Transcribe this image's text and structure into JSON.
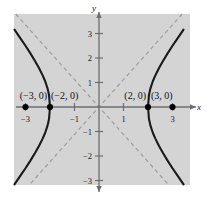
{
  "figure": {
    "title": "",
    "background_color": "#ffffff",
    "plot_background_color": "#d4d4d4",
    "axis_color": "#6e6e6e",
    "curve_color": "#1a1a1a",
    "asymptote_color": "#9a9a9a",
    "point_color": "#000000"
  },
  "axes": {
    "x_label": "x",
    "y_label": "y",
    "x_ticks": [
      {
        "value": -3,
        "label": "−3"
      },
      {
        "value": -1,
        "label": "−1"
      },
      {
        "value": 1,
        "label": "1"
      },
      {
        "value": 3,
        "label": "3"
      }
    ],
    "y_ticks": [
      {
        "value": 3,
        "label": "3"
      },
      {
        "value": 2,
        "label": "2"
      },
      {
        "value": 1,
        "label": "1"
      },
      {
        "value": -1,
        "label": "−1"
      },
      {
        "value": -2,
        "label": "−2"
      },
      {
        "value": -3,
        "label": "−3"
      }
    ]
  },
  "chart_data": {
    "type": "line",
    "title": "",
    "xlabel": "x",
    "ylabel": "y",
    "xlim": [
      -3.6,
      3.6
    ],
    "ylim": [
      -3.5,
      3.5
    ],
    "grid": false,
    "legend": "none",
    "curve_equation": "x^2/4 - y^2/5 = 1",
    "transverse_axis": "horizontal",
    "a": 2,
    "b": 2.2360679775,
    "c": 3,
    "asymptote_slope": 1.118,
    "vertices": [
      {
        "x": -2,
        "y": 0,
        "label": "(−2, 0)"
      },
      {
        "x": 2,
        "y": 0,
        "label": "(2, 0)"
      }
    ],
    "foci": [
      {
        "x": -3,
        "y": 0,
        "label": "(−3, 0)"
      },
      {
        "x": 3,
        "y": 0,
        "label": "(3, 0)"
      }
    ],
    "marked_points": [
      {
        "x": -3,
        "y": 0,
        "label": "(−3, 0)"
      },
      {
        "x": -2,
        "y": 0,
        "label": "(−2, 0)"
      },
      {
        "x": 2,
        "y": 0,
        "label": "(2, 0)"
      },
      {
        "x": 3,
        "y": 0,
        "label": "(3, 0)"
      }
    ],
    "series": [
      {
        "name": "left branch",
        "points": [
          {
            "x": -3.45,
            "y": 3.16
          },
          {
            "x": -3.2,
            "y": 2.79
          },
          {
            "x": -3.0,
            "y": 2.5
          },
          {
            "x": -2.8,
            "y": 2.19
          },
          {
            "x": -2.6,
            "y": 1.86
          },
          {
            "x": -2.45,
            "y": 1.59
          },
          {
            "x": -2.3,
            "y": 1.29
          },
          {
            "x": -2.2,
            "y": 1.06
          },
          {
            "x": -2.1,
            "y": 0.76
          },
          {
            "x": -2.04,
            "y": 0.49
          },
          {
            "x": -2.0,
            "y": 0.0
          },
          {
            "x": -2.04,
            "y": -0.49
          },
          {
            "x": -2.1,
            "y": -0.76
          },
          {
            "x": -2.2,
            "y": -1.06
          },
          {
            "x": -2.3,
            "y": -1.29
          },
          {
            "x": -2.45,
            "y": -1.59
          },
          {
            "x": -2.6,
            "y": -1.86
          },
          {
            "x": -2.8,
            "y": -2.19
          },
          {
            "x": -3.0,
            "y": -2.5
          },
          {
            "x": -3.2,
            "y": -2.79
          },
          {
            "x": -3.45,
            "y": -3.16
          }
        ]
      },
      {
        "name": "right branch",
        "points": [
          {
            "x": 3.45,
            "y": 3.16
          },
          {
            "x": 3.2,
            "y": 2.79
          },
          {
            "x": 3.0,
            "y": 2.5
          },
          {
            "x": 2.8,
            "y": 2.19
          },
          {
            "x": 2.6,
            "y": 1.86
          },
          {
            "x": 2.45,
            "y": 1.59
          },
          {
            "x": 2.3,
            "y": 1.29
          },
          {
            "x": 2.2,
            "y": 1.06
          },
          {
            "x": 2.1,
            "y": 0.76
          },
          {
            "x": 2.04,
            "y": 0.49
          },
          {
            "x": 2.0,
            "y": 0.0
          },
          {
            "x": 2.04,
            "y": -0.49
          },
          {
            "x": 2.1,
            "y": -0.76
          },
          {
            "x": 2.2,
            "y": -1.06
          },
          {
            "x": 2.3,
            "y": -1.29
          },
          {
            "x": 2.45,
            "y": -1.59
          },
          {
            "x": 2.6,
            "y": -1.86
          },
          {
            "x": 2.8,
            "y": -2.19
          },
          {
            "x": 3.0,
            "y": -2.5
          },
          {
            "x": 3.2,
            "y": -2.79
          },
          {
            "x": 3.45,
            "y": -3.16
          }
        ]
      }
    ],
    "asymptotes": [
      {
        "name": "asymptote-positive-slope",
        "slope": 1.118,
        "intercept": 0
      },
      {
        "name": "asymptote-negative-slope",
        "slope": -1.118,
        "intercept": 0
      }
    ]
  }
}
